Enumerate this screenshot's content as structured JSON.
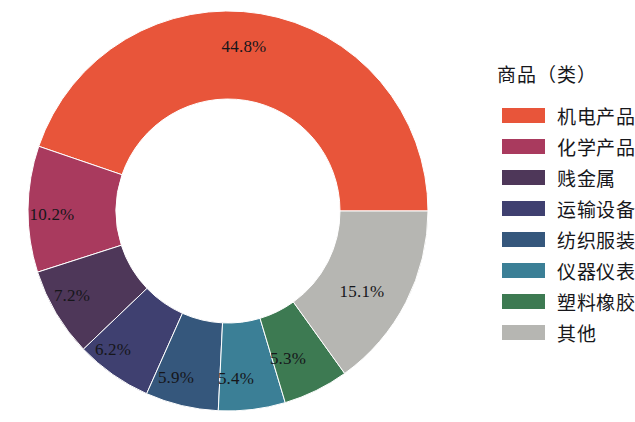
{
  "legend": {
    "title": "商品（类）"
  },
  "chart_data": {
    "type": "pie",
    "variant": "donut",
    "title": "",
    "legend_title": "商品（类）",
    "legend_position": "right",
    "start_angle_deg": 0,
    "direction": "counterclockwise",
    "inner_radius_ratio": 0.56,
    "categories": [
      "机电产品",
      "化学产品",
      "贱金属",
      "运输设备",
      "纺织服装",
      "仪器仪表",
      "塑料橡胶",
      "其他"
    ],
    "values": [
      44.8,
      10.2,
      7.2,
      6.2,
      5.9,
      5.4,
      5.3,
      15.1
    ],
    "value_labels": [
      "44.8%",
      "10.2%",
      "7.2%",
      "6.2%",
      "5.9%",
      "5.4%",
      "5.3%",
      "15.1%"
    ],
    "colors": [
      "#E8553A",
      "#A93A5E",
      "#4E3759",
      "#3F4070",
      "#35577C",
      "#3B7F96",
      "#3D7A52",
      "#B6B6B2"
    ],
    "slices": [
      {
        "label": "机电产品",
        "value": 44.8,
        "value_label": "44.8%",
        "color": "#E8553A",
        "label_x": 244,
        "label_y": 47
      },
      {
        "label": "化学产品",
        "value": 10.2,
        "value_label": "10.2%",
        "color": "#A93A5E",
        "label_x": 52,
        "label_y": 215
      },
      {
        "label": "贱金属",
        "value": 7.2,
        "value_label": "7.2%",
        "color": "#4E3759",
        "label_x": 72,
        "label_y": 296
      },
      {
        "label": "运输设备",
        "value": 6.2,
        "value_label": "6.2%",
        "color": "#3F4070",
        "label_x": 113,
        "label_y": 350
      },
      {
        "label": "纺织服装",
        "value": 5.9,
        "value_label": "5.9%",
        "color": "#35577C",
        "label_x": 176,
        "label_y": 378
      },
      {
        "label": "仪器仪表",
        "value": 5.4,
        "value_label": "5.4%",
        "color": "#3B7F96",
        "label_x": 236,
        "label_y": 379
      },
      {
        "label": "塑料橡胶",
        "value": 5.3,
        "value_label": "5.3%",
        "color": "#3D7A52",
        "label_x": 288,
        "label_y": 359
      },
      {
        "label": "其他",
        "value": 15.1,
        "value_label": "15.1%",
        "color": "#B6B6B2",
        "label_x": 362,
        "label_y": 292
      }
    ],
    "center": {
      "x": 228,
      "y": 211
    },
    "outer_radius": 200,
    "inner_radius": 112
  }
}
